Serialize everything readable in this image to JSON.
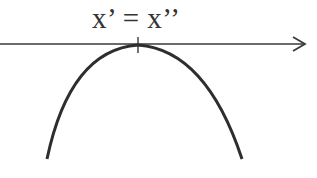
{
  "diagram": {
    "label": "x’ = x’’",
    "axis": {
      "direction": "right",
      "has_arrow": true,
      "color": "#3a3a3a"
    },
    "curve": {
      "shape": "downward parabola",
      "vertex_on_axis": true,
      "color": "#2e2e2e"
    },
    "tick": {
      "position": "vertex",
      "marked": true
    }
  }
}
